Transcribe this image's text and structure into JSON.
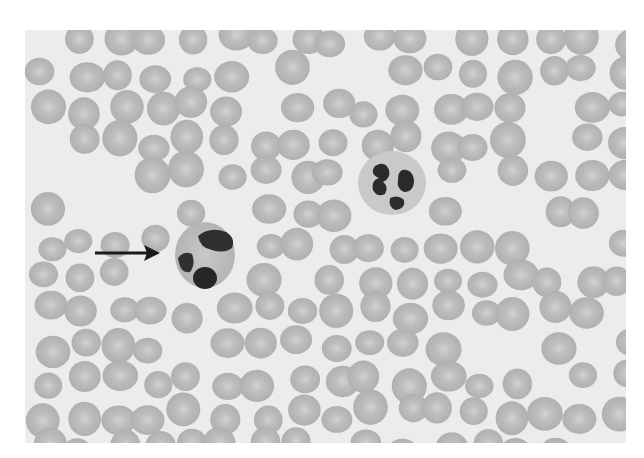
{
  "figure": {
    "background_color": "#ffffff",
    "smear_background": "#ececec",
    "rbc_color": "#b9b9b9",
    "nucleus_color": "#2a2a2a",
    "cells": {
      "rbc_count_estimate": "many",
      "leukocytes": [
        {
          "label": "arrowed-leukocyte",
          "center": [
            207,
            255
          ],
          "lobes": 3
        },
        {
          "label": "segmented-neutrophil",
          "center": [
            393,
            182
          ],
          "lobes": 4
        }
      ]
    },
    "annotation": {
      "type": "arrow",
      "from": [
        95,
        253
      ],
      "to": [
        158,
        253
      ],
      "color": "#1a1a1a"
    }
  }
}
